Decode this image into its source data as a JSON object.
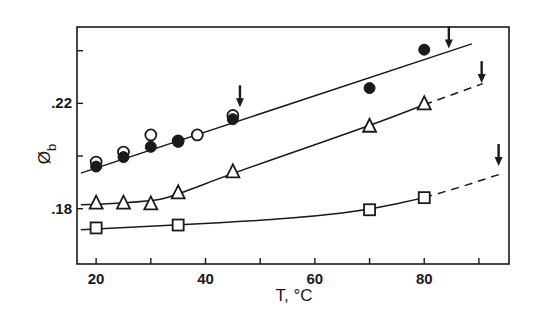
{
  "chart_data": {
    "type": "scatter",
    "title": "",
    "xlabel": "T, °C",
    "ylabel": "Ø_b",
    "ylabel_main": "Ø",
    "ylabel_sub": "b",
    "xlim": [
      16.5,
      95.5
    ],
    "ylim": [
      0.159,
      0.249
    ],
    "grid": false,
    "legend": null,
    "x_ticks": [
      20,
      30,
      40,
      50,
      60,
      70,
      80,
      90
    ],
    "x_tick_labels": [
      {
        "value": 20,
        "label": "20"
      },
      {
        "value": 40,
        "label": "40"
      },
      {
        "value": 60,
        "label": "60"
      },
      {
        "value": 80,
        "label": "80"
      }
    ],
    "y_ticks": [
      0.18,
      0.2,
      0.22,
      0.24
    ],
    "y_tick_labels": [
      {
        "value": 0.18,
        "label": ".18"
      },
      {
        "value": 0.22,
        "label": ".22"
      }
    ],
    "series": [
      {
        "name": "filled circles",
        "marker": "filled-circle",
        "x": [
          20,
          25,
          30,
          35,
          45,
          70,
          80
        ],
        "y": [
          0.196,
          0.1996,
          0.2035,
          0.2054,
          0.214,
          0.2258,
          0.2404
        ]
      },
      {
        "name": "open circles",
        "marker": "open-circle",
        "x": [
          20,
          25,
          30,
          35,
          38.5,
          45
        ],
        "y": [
          0.1977,
          0.2015,
          0.208,
          0.2057,
          0.208,
          0.2154
        ]
      },
      {
        "name": "triangles",
        "marker": "open-triangle",
        "x": [
          20,
          25,
          30,
          35,
          45,
          70,
          80
        ],
        "y": [
          0.1823,
          0.1823,
          0.182,
          0.1862,
          0.1942,
          0.2115,
          0.22
        ]
      },
      {
        "name": "squares",
        "marker": "open-square",
        "x": [
          20,
          35,
          70,
          80
        ],
        "y": [
          0.1727,
          0.1738,
          0.1796,
          0.1842
        ]
      }
    ],
    "fit_lines": [
      {
        "name": "circles fit",
        "style": "solid",
        "points": [
          [
            17.2,
            0.1935
          ],
          [
            88.7,
            0.2426
          ]
        ]
      },
      {
        "name": "triangles fit",
        "style": "solid",
        "points": [
          [
            17.2,
            0.1815
          ],
          [
            30,
            0.1825
          ],
          [
            35,
            0.1855
          ],
          [
            45,
            0.1935
          ],
          [
            70,
            0.2115
          ],
          [
            80,
            0.2195
          ]
        ]
      },
      {
        "name": "triangles extrapolation",
        "style": "dashed",
        "points": [
          [
            80,
            0.2195
          ],
          [
            90.7,
            0.2275
          ]
        ]
      },
      {
        "name": "squares fit",
        "style": "solid",
        "points": [
          [
            17.2,
            0.172
          ],
          [
            35,
            0.1738
          ],
          [
            50,
            0.1755
          ],
          [
            60,
            0.1772
          ],
          [
            70,
            0.1796
          ],
          [
            80,
            0.1842
          ]
        ]
      },
      {
        "name": "squares extrapolation",
        "style": "dashed",
        "points": [
          [
            80,
            0.1842
          ],
          [
            86,
            0.1878
          ],
          [
            93.7,
            0.193
          ]
        ]
      }
    ],
    "annotations": [
      {
        "type": "arrow-down",
        "x": 46.3,
        "y_tip": 0.2185,
        "note": "transition marker on circles line"
      },
      {
        "type": "arrow-down",
        "x": 84.5,
        "y_tip": 0.2408,
        "note": "transition marker on circles line"
      },
      {
        "type": "arrow-down",
        "x": 90.5,
        "y_tip": 0.2277,
        "note": "transition marker on triangles line"
      },
      {
        "type": "arrow-down",
        "x": 93.6,
        "y_tip": 0.1962,
        "note": "transition marker on squares line"
      }
    ]
  },
  "colors": {
    "ink": "#1a1a1a",
    "background": "#ffffff"
  }
}
